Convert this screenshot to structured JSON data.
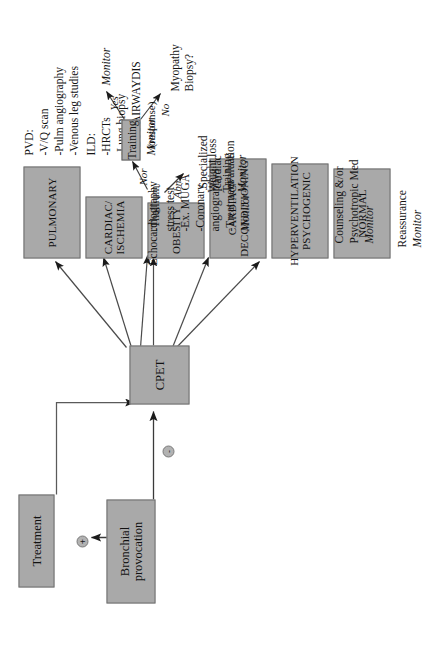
{
  "diagram": {
    "colors": {
      "box_fill": "#a9a9a9",
      "box_border": "#6f6f6f",
      "edge": "#555555",
      "text": "#141414"
    },
    "nodes": {
      "bronchial": "Bronchial\nprovocation",
      "treatment": "Treatment",
      "cpet": "CPET",
      "normal": "NORMAL",
      "hyperventilation": "HYPERVENTILATION\nPSYCHOGENIC",
      "deconditioning": "CARDIAC/\nDECONDITIONING",
      "obesity": "OBESITY",
      "ischemia": "CARDIAC/\nISCHEMIA",
      "pulmonary": "PULMONARY",
      "training": "Training"
    },
    "signs": {
      "positive": "+",
      "negative": "-"
    },
    "annotations": {
      "normal": {
        "line1": "Reassurance",
        "line2": "Monitor"
      },
      "hyperventilation": {
        "line1": "Counseling &/or",
        "line2": "Psychotropic Med",
        "line3": "Monitor"
      },
      "deconditioning": {
        "echo": "Echocardiography",
        "abn": "Abn",
        "nor": "Nor",
        "specialized": "Specialized\ncardiac\nevaluation",
        "response": "(response)",
        "yes": "Yes",
        "no": "No",
        "monitor": "Monitor",
        "myopathy": "Myopathy\nBiopsy?"
      },
      "obesity": {
        "line1": "Weight loss",
        "line2": "Training",
        "line3": "Monitor"
      },
      "ischemia": {
        "line1": "-Thallium",
        "line2": "stress test",
        "line3": "-Ex. MUGA",
        "line4": "-Coronary",
        "line5": "angiography",
        "line6": "-Treatment",
        "line7": "Monitor"
      },
      "pulmonary": {
        "line1": "PVD:",
        "line2": "-V/Q scan",
        "line3": "-Pulm angiography",
        "line4": "-Venous leg studies",
        "line5": "ILD:",
        "line6": "-HRCTs",
        "line7": "-Lung biopsy",
        "line8": "OBST AIRWAYDIS",
        "line9": "Monitor"
      }
    }
  }
}
